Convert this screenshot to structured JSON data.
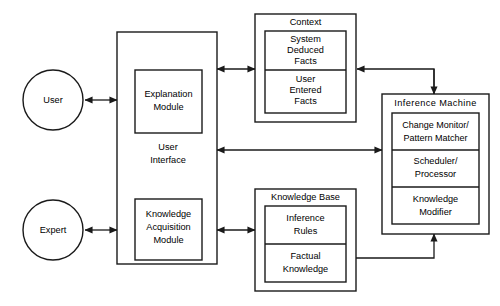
{
  "diagram": {
    "type": "block-diagram",
    "stroke_color": "#1a1a1a",
    "background_color": "#ffffff",
    "actors": [
      {
        "id": "user",
        "label": "User",
        "shape": "circle"
      },
      {
        "id": "expert",
        "label": "Expert",
        "shape": "circle"
      }
    ],
    "containers": [
      {
        "id": "user-interface",
        "label": "User",
        "label_line2": "Interface",
        "children": [
          {
            "id": "explanation-module",
            "label": "Explanation",
            "label_line2": "Module"
          },
          {
            "id": "knowledge-acquisition-module",
            "label": "Knowledge",
            "label_line2": "Acquisition",
            "label_line3": "Module"
          }
        ]
      },
      {
        "id": "context",
        "label": "Context",
        "children": [
          {
            "id": "system-deduced-facts",
            "label": "System",
            "label_line2": "Deduced",
            "label_line3": "Facts"
          },
          {
            "id": "user-entered-facts",
            "label": "User",
            "label_line2": "Entered",
            "label_line3": "Facts"
          }
        ]
      },
      {
        "id": "inference-machine",
        "label": "Inference  Machine",
        "children": [
          {
            "id": "change-monitor-pattern-matcher",
            "label": "Change  Monitor/",
            "label_line2": "Pattern  Matcher"
          },
          {
            "id": "scheduler-processor",
            "label": "Scheduler/",
            "label_line2": "Processor"
          },
          {
            "id": "knowledge-modifier",
            "label": "Knowledge",
            "label_line2": "Modifier"
          }
        ]
      },
      {
        "id": "knowledge-base",
        "label": "Knowledge Base",
        "children": [
          {
            "id": "inference-rules",
            "label": "Inference",
            "label_line2": "Rules"
          },
          {
            "id": "factual-knowledge",
            "label": "Factual",
            "label_line2": "Knowledge"
          }
        ]
      }
    ],
    "connections": [
      {
        "id": "user-to-interface",
        "from": "user",
        "to": "user-interface",
        "direction": "bidirectional"
      },
      {
        "id": "expert-to-interface",
        "from": "expert",
        "to": "user-interface",
        "direction": "bidirectional"
      },
      {
        "id": "interface-to-context",
        "from": "user-interface",
        "to": "context",
        "direction": "bidirectional"
      },
      {
        "id": "interface-to-knowledge-base",
        "from": "user-interface",
        "to": "knowledge-base",
        "direction": "bidirectional"
      },
      {
        "id": "interface-to-inference-machine",
        "from": "user-interface",
        "to": "inference-machine",
        "direction": "bidirectional"
      },
      {
        "id": "inference-machine-to-context",
        "from": "inference-machine",
        "to": "context",
        "direction": "unidirectional"
      },
      {
        "id": "knowledge-base-to-inference-machine",
        "from": "knowledge-base",
        "to": "inference-machine",
        "direction": "unidirectional"
      }
    ]
  }
}
